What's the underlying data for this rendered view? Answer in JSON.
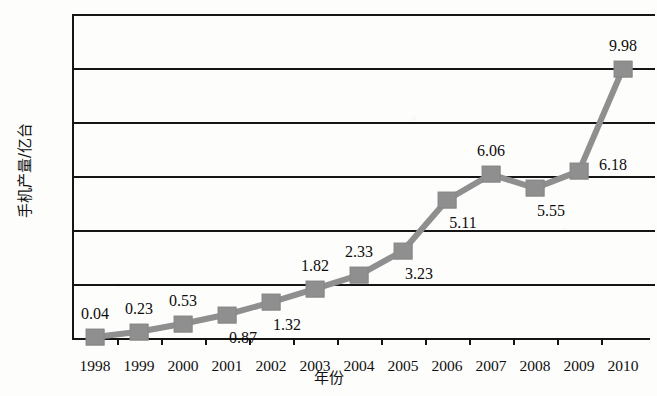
{
  "chart_data": {
    "type": "line",
    "title": "",
    "xlabel": "年份",
    "ylabel": "手机产量/亿台",
    "categories": [
      "1998",
      "1999",
      "2000",
      "2001",
      "2002",
      "2003",
      "2004",
      "2005",
      "2006",
      "2007",
      "2008",
      "2009",
      "2010"
    ],
    "values": [
      0.04,
      0.23,
      0.53,
      0.87,
      1.32,
      1.82,
      2.33,
      3.23,
      5.11,
      6.06,
      5.55,
      6.18,
      9.98
    ],
    "point_labels": [
      "0.04",
      "0.23",
      "0.53",
      "0.87",
      "1.32",
      "1.82",
      "2.33",
      "3.23",
      "5.11",
      "6.06",
      "5.55",
      "6.18",
      "9.98"
    ],
    "label_positions": [
      "above",
      "above",
      "above",
      "below",
      "below",
      "above",
      "above",
      "below",
      "below",
      "above",
      "below",
      "right",
      "above"
    ],
    "ylim": [
      0,
      12
    ],
    "yticks": [
      0,
      2,
      4,
      6,
      8,
      10,
      12
    ],
    "ytick_labels": [
      "0",
      "2",
      "4",
      "6",
      "8",
      "10",
      "12"
    ],
    "grid": true,
    "legend": "none",
    "series_color": "#8f8f8f",
    "axis_color": "#151515",
    "marker": "square"
  }
}
